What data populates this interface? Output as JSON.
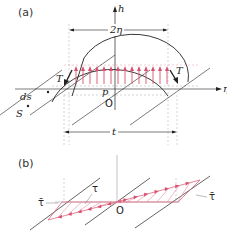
{
  "panel_a": {
    "label": "(a)",
    "axis_h": "h",
    "axis_eta": "η",
    "dim_top": "2η",
    "dim_bottom": "t",
    "tension_left": "T",
    "tension_right": "T",
    "pressure": "p",
    "origin": "O",
    "ds": "ds",
    "s": "S"
  },
  "panel_b": {
    "label": "(b)",
    "tau": "τ",
    "tau_bar_left": "τ̄",
    "tau_bar_right": "τ̄",
    "origin": "O"
  },
  "colors": {
    "line": "#222222",
    "arrow_pink": "#d9506e",
    "hatch_pink": "#e58aa0",
    "dash": "#999999"
  }
}
